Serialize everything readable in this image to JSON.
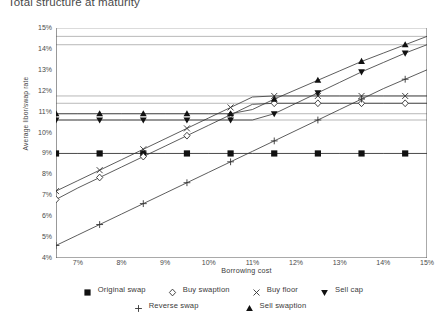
{
  "chart_data": {
    "type": "line",
    "title": "Total structure at maturity",
    "xlabel": "Borrowing cost",
    "ylabel": "Average libor/swap rate",
    "xlim": [
      6.5,
      15.0
    ],
    "ylim": [
      4,
      15
    ],
    "grid": false,
    "legend_position": "bottom",
    "x_ticks": [
      "7%",
      "8%",
      "9%",
      "10%",
      "11%",
      "12%",
      "13%",
      "14%",
      "15%"
    ],
    "x_tick_values": [
      7,
      8,
      9,
      10,
      11,
      12,
      13,
      14,
      15
    ],
    "y_ticks": [
      "4%",
      "5%",
      "6%",
      "7%",
      "8%",
      "9%",
      "10%",
      "11%",
      "12%",
      "13%",
      "14%",
      "15%"
    ],
    "y_tick_values": [
      4,
      5,
      6,
      7,
      8,
      9,
      10,
      11,
      12,
      13,
      14,
      15
    ],
    "x": [
      6.5,
      7.0,
      7.5,
      8.0,
      8.5,
      9.0,
      9.5,
      10.0,
      10.5,
      11.0,
      11.5,
      12.0,
      12.5,
      13.0,
      13.5,
      14.0,
      14.5,
      15.0
    ],
    "series": [
      {
        "name": "Original swap",
        "marker": "filled-square",
        "values": [
          9.0,
          9.0,
          9.0,
          9.0,
          9.0,
          9.0,
          9.0,
          9.0,
          9.0,
          9.0,
          9.0,
          9.0,
          9.0,
          9.0,
          9.0,
          9.0,
          9.0,
          9.0
        ]
      },
      {
        "name": "Buy swaption",
        "marker": "open-diamond",
        "values": [
          6.8,
          7.35,
          7.85,
          8.35,
          8.85,
          9.35,
          9.85,
          10.35,
          10.85,
          11.35,
          11.4,
          11.4,
          11.4,
          11.4,
          11.4,
          11.4,
          11.4,
          11.4
        ]
      },
      {
        "name": "Buy floor",
        "marker": "cross-x",
        "values": [
          7.2,
          7.7,
          8.2,
          8.7,
          9.2,
          9.7,
          10.2,
          10.7,
          11.2,
          11.7,
          11.75,
          11.75,
          11.75,
          11.75,
          11.75,
          11.75,
          11.75,
          11.75
        ]
      },
      {
        "name": "Sell cap",
        "marker": "filled-down-triangle",
        "values": [
          10.6,
          10.6,
          10.6,
          10.6,
          10.6,
          10.6,
          10.6,
          10.6,
          10.6,
          10.6,
          10.9,
          11.4,
          11.9,
          12.4,
          12.9,
          13.35,
          13.8,
          14.2
        ]
      },
      {
        "name": "Reverse swap",
        "marker": "plus",
        "values": [
          4.6,
          5.1,
          5.6,
          6.1,
          6.6,
          7.1,
          7.6,
          8.1,
          8.6,
          9.1,
          9.6,
          10.1,
          10.6,
          11.1,
          11.6,
          12.1,
          12.55,
          13.0
        ]
      },
      {
        "name": "Sell swaption",
        "marker": "filled-up-triangle",
        "values": [
          10.9,
          10.9,
          10.9,
          10.9,
          10.9,
          10.9,
          10.9,
          10.9,
          10.9,
          11.1,
          11.6,
          12.05,
          12.5,
          12.95,
          13.4,
          13.8,
          14.2,
          14.6
        ]
      }
    ],
    "reference_lines": [
      {
        "name": "sell-swaption-plateau",
        "value": 10.9
      },
      {
        "name": "sell-cap-plateau",
        "value": 10.6
      },
      {
        "name": "original-swap-level",
        "value": 9.0
      },
      {
        "name": "buy-floor-plateau",
        "value": 11.75
      },
      {
        "name": "buy-swaption-plateau",
        "value": 11.4
      },
      {
        "name": "sell-cap-max",
        "value": 14.2
      },
      {
        "name": "sell-swaption-max",
        "value": 14.6
      }
    ]
  },
  "legend": {
    "row1": [
      {
        "label": "Original swap",
        "marker": "filled-square"
      },
      {
        "label": "Buy swaption",
        "marker": "open-diamond"
      },
      {
        "label": "Buy floor",
        "marker": "cross-x"
      },
      {
        "label": "Sell cap",
        "marker": "filled-down-triangle"
      }
    ],
    "row2": [
      {
        "label": "Reverse swap",
        "marker": "plus"
      },
      {
        "label": "Sell swaption",
        "marker": "filled-up-triangle"
      }
    ]
  }
}
